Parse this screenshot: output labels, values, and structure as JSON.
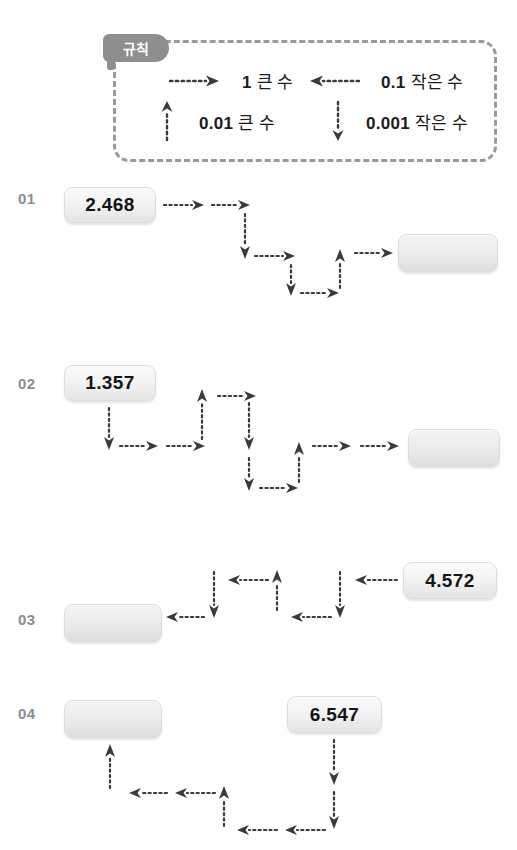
{
  "worksheet": {
    "rule_panel": {
      "tab_label": "규칙",
      "entries": [
        {
          "arrow": "right-arrow-icon",
          "direction": "right",
          "value": "1",
          "word": "큰 수",
          "full": "1 큰 수"
        },
        {
          "arrow": "left-arrow-icon",
          "direction": "left",
          "value": "0.1",
          "word": "작은 수",
          "full": "0.1 작은 수"
        },
        {
          "arrow": "up-arrow-icon",
          "direction": "up",
          "value": "0.01",
          "word": "큰 수",
          "full": "0.01 큰 수"
        },
        {
          "arrow": "down-arrow-icon",
          "direction": "down",
          "value": "0.001",
          "word": "작은 수",
          "full": "0.001 작은 수"
        }
      ]
    },
    "problems": [
      {
        "label": "01",
        "start_value": "2.468",
        "answer_value": "",
        "path": [
          "right",
          "right",
          "down",
          "right",
          "down",
          "right",
          "up",
          "right"
        ]
      },
      {
        "label": "02",
        "start_value": "1.357",
        "answer_value": "",
        "path": [
          "down",
          "right",
          "right",
          "up",
          "right",
          "down",
          "down",
          "right",
          "up",
          "right",
          "right"
        ]
      },
      {
        "label": "03",
        "start_value": "4.572",
        "answer_value": "",
        "path": [
          "left",
          "down",
          "left",
          "up",
          "left",
          "down",
          "left"
        ]
      },
      {
        "label": "04",
        "start_value": "6.547",
        "answer_value": "",
        "path": [
          "down",
          "down",
          "left",
          "left",
          "up",
          "left",
          "left",
          "up"
        ]
      }
    ]
  },
  "colors": {
    "tab_fill": "#8e8e8e",
    "dash_border": "#9a9a9a",
    "label_gray": "#8d8d8d",
    "arrow": "#3a3a3a",
    "chip_face": "#f1f1f1",
    "text_dark": "#151515"
  }
}
